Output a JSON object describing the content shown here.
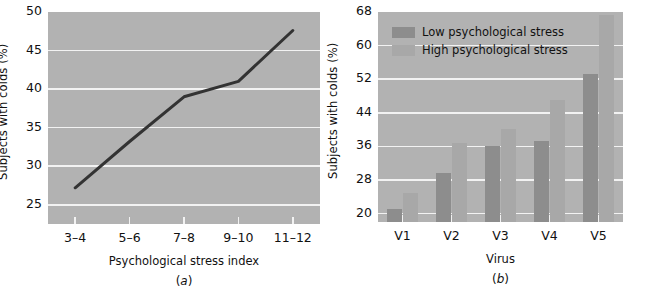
{
  "figure": {
    "background": "#ffffff",
    "plot_background": "#b2b2b2",
    "gridline_color": "#f2f2f2",
    "text_color": "#111111"
  },
  "chart_data": [
    {
      "id": "panel-a",
      "type": "line",
      "title": "",
      "caption": "(a)",
      "caption_letter": "a",
      "xlabel": "Psychological stress index",
      "ylabel": "Subjects with colds (%)",
      "categories": [
        "3–4",
        "5–6",
        "7–8",
        "9–10",
        "11–12"
      ],
      "values": [
        27.2,
        33.2,
        39.0,
        41.0,
        47.6
      ],
      "yticks": [
        50,
        45,
        40,
        35,
        30,
        25
      ],
      "ylim": [
        22.5,
        50
      ],
      "grid": true,
      "legend": null,
      "line_color": "#333333"
    },
    {
      "id": "panel-b",
      "type": "bar",
      "title": "",
      "caption": "(b)",
      "caption_letter": "b",
      "xlabel": "Virus",
      "ylabel": "Subjects with colds (%)",
      "categories": [
        "V1",
        "V2",
        "V3",
        "V4",
        "V5"
      ],
      "series": [
        {
          "name": "Low psychological stress",
          "color": "#8d8d8d",
          "values": [
            21.0,
            29.6,
            36.0,
            37.4,
            53.2
          ]
        },
        {
          "name": "High psychological stress",
          "color": "#a8a8a8",
          "values": [
            25.0,
            36.8,
            40.2,
            47.0,
            67.4
          ]
        }
      ],
      "yticks": [
        68,
        60,
        52,
        44,
        36,
        28,
        20
      ],
      "ylim": [
        18.0,
        68
      ],
      "grid": true,
      "legend_position": "top-left"
    }
  ]
}
